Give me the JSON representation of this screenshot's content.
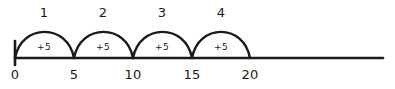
{
  "figure": {
    "kind": "number-line-skip-counting",
    "background_color": "#ffffff",
    "stroke_color": "#1a1a1a",
    "text_color": "#1a1a1a",
    "axis": {
      "line_start_x": 15,
      "line_end_x": 383,
      "baseline_y": 58,
      "line_thickness": 2.6,
      "origin_tick": {
        "x": 15,
        "top_y": 41,
        "bottom_y": 65,
        "thickness": 2.6
      }
    },
    "ticks": [
      {
        "label": "0",
        "value": 0,
        "x": 15
      },
      {
        "label": "5",
        "value": 5,
        "x": 74
      },
      {
        "label": "10",
        "value": 10,
        "x": 133
      },
      {
        "label": "15",
        "value": 15,
        "x": 192
      },
      {
        "label": "20",
        "value": 20,
        "x": 250
      }
    ],
    "tick_label_y": 68,
    "hop_label_y": 6,
    "hops": [
      {
        "number": "1",
        "amount": "+5",
        "from": 0,
        "to": 5,
        "start_x": 15,
        "end_x": 74,
        "center_x": 44,
        "peak_y": 32,
        "label_x": 44,
        "arc_text_y": 43
      },
      {
        "number": "2",
        "amount": "+5",
        "from": 5,
        "to": 10,
        "start_x": 74,
        "end_x": 133,
        "center_x": 103,
        "peak_y": 32,
        "label_x": 103,
        "arc_text_y": 43
      },
      {
        "number": "3",
        "amount": "+5",
        "from": 10,
        "to": 15,
        "start_x": 133,
        "end_x": 192,
        "center_x": 162,
        "peak_y": 32,
        "label_x": 162,
        "arc_text_y": 43
      },
      {
        "number": "4",
        "amount": "+5",
        "from": 15,
        "to": 20,
        "start_x": 192,
        "end_x": 250,
        "center_x": 221,
        "peak_y": 32,
        "label_x": 221,
        "arc_text_y": 43
      }
    ]
  }
}
